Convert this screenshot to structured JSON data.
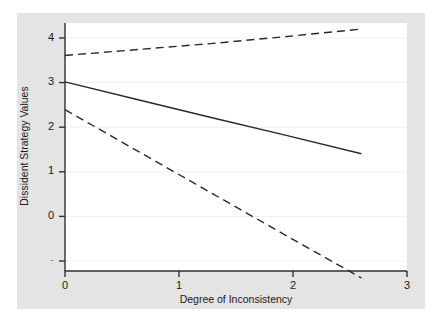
{
  "figure": {
    "background_color": "#ffffff",
    "graph_region_color": "#e4e4e4",
    "plot_area_color": "#ffffff",
    "gridline_color": "#f0f0f0",
    "axis_color": "#303030",
    "line_color": "#2a2a2a"
  },
  "chart_data": {
    "type": "line",
    "title": "",
    "subtitle": "",
    "xlabel": "Degree of Inconsistency",
    "ylabel": "Dissident Strategy Values",
    "xlim": [
      0,
      3
    ],
    "ylim": [
      -1,
      4.35
    ],
    "xticks": [
      0,
      1,
      2,
      3
    ],
    "xtick_labels": [
      "0",
      "1",
      "2",
      "3"
    ],
    "yticks": [
      -1,
      0,
      1,
      2,
      3,
      4
    ],
    "ytick_labels": [
      "-",
      "0",
      "1",
      "2",
      "3",
      "4"
    ],
    "grid": true,
    "grid_axis": "y",
    "legend": "none",
    "x": [
      0,
      0.65,
      1.3,
      1.95,
      2.6
    ],
    "series": [
      {
        "name": "Upper 95% confidence bound",
        "style": "dashed",
        "values": [
          3.65,
          3.78,
          3.91,
          4.06,
          4.22
        ]
      },
      {
        "name": "Predicted dissident strategy value",
        "style": "solid",
        "values": [
          3.08,
          2.69,
          2.3,
          1.92,
          1.53
        ]
      },
      {
        "name": "Lower 95% confidence bound",
        "style": "dashed",
        "values": [
          2.48,
          1.57,
          0.66,
          -0.25,
          -1.15
        ]
      }
    ]
  },
  "axes": {
    "x_title": "Degree of Inconsistency",
    "y_title": "Dissident Strategy Values",
    "x_tick_0": "0",
    "x_tick_1": "1",
    "x_tick_2": "2",
    "x_tick_3": "3",
    "y_tick_4": "4",
    "y_tick_3": "3",
    "y_tick_2": "2",
    "y_tick_1": "1",
    "y_tick_0": "0",
    "y_tick_neg1": "-"
  }
}
